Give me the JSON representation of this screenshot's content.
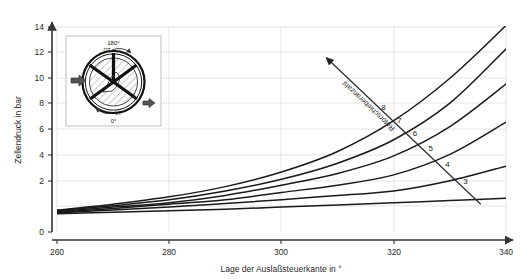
{
  "chart_data": {
    "type": "line",
    "title": "",
    "xlabel": "Lage der Auslaßsteuerkante in °",
    "ylabel": "Zellendruck in bar",
    "xlim": [
      260,
      340
    ],
    "ylim": [
      0,
      14
    ],
    "xticks": [
      260,
      280,
      300,
      320,
      340
    ],
    "yticks": [
      0,
      2,
      4,
      6,
      8,
      10,
      12,
      14
    ],
    "grid": true,
    "legend": "none",
    "series_label": "Rotorschieberanzahl",
    "x": [
      260,
      270,
      280,
      290,
      300,
      310,
      320,
      330,
      340
    ],
    "series": [
      {
        "name": "8",
        "values": [
          1.5,
          1.9,
          2.4,
          3.1,
          4.1,
          5.5,
          7.6,
          10.5,
          14.1
        ]
      },
      {
        "name": "7",
        "values": [
          1.45,
          1.8,
          2.2,
          2.8,
          3.6,
          4.7,
          6.3,
          8.8,
          12.5
        ]
      },
      {
        "name": "6",
        "values": [
          1.4,
          1.7,
          2.0,
          2.5,
          3.2,
          4.0,
          5.2,
          7.2,
          10.1
        ]
      },
      {
        "name": "5",
        "values": [
          1.35,
          1.6,
          1.9,
          2.2,
          2.7,
          3.2,
          3.9,
          5.3,
          7.5
        ]
      },
      {
        "name": "4",
        "values": [
          1.3,
          1.5,
          1.7,
          1.95,
          2.2,
          2.5,
          2.8,
          3.5,
          4.5
        ]
      },
      {
        "name": "3",
        "values": [
          1.25,
          1.35,
          1.45,
          1.55,
          1.7,
          1.85,
          2.0,
          2.15,
          2.3
        ]
      }
    ],
    "curve_labels": [
      {
        "name": "8",
        "x": 318.2,
        "y": 8.35
      },
      {
        "name": "7",
        "x": 321.0,
        "y": 7.45
      },
      {
        "name": "6",
        "x": 323.8,
        "y": 6.55
      },
      {
        "name": "5",
        "x": 326.6,
        "y": 5.55
      },
      {
        "name": "4",
        "x": 329.6,
        "y": 4.45
      },
      {
        "name": "3",
        "x": 332.8,
        "y": 3.25
      }
    ],
    "annotation": {
      "text": "Rotorschieberanzahl",
      "arrow_from": [
        335.5,
        1.9
      ],
      "arrow_to": [
        308.0,
        11.9
      ]
    }
  },
  "inset": {
    "name": "rotary-engine-cross-section",
    "top_angle": "180°",
    "top_marker": "OT",
    "bottom_marker": "UT",
    "bottom_angle": "0°",
    "inlet_arrow": "inlet-flow-arrow",
    "outlet_arrow": "outlet-flow-arrow"
  },
  "colors": {
    "curve": "#1a1a1a",
    "axis": "#333333",
    "grid": "#d8d8d8",
    "text": "#2b2b2b",
    "inset_border": "#aaaaaa",
    "hatch": "#555555"
  }
}
